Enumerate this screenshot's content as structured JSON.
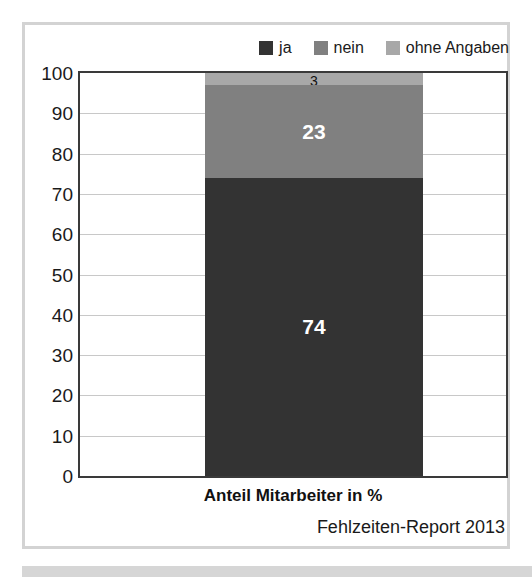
{
  "chart_data": {
    "type": "bar",
    "title": "",
    "subtitle": "",
    "xlabel": "Anteil Mitarbeiter in %",
    "ylabel": "",
    "categories": [
      "Anteil Mitarbeiter in %"
    ],
    "stacked": true,
    "ylim": [
      0,
      100
    ],
    "yticks": [
      0,
      10,
      20,
      30,
      40,
      50,
      60,
      70,
      80,
      90,
      100
    ],
    "ytick_labels": [
      "0",
      "10",
      "20",
      "30",
      "40",
      "50",
      "60",
      "70",
      "80",
      "90",
      "100"
    ],
    "grid": true,
    "legend_position": "top-right",
    "series": [
      {
        "name": "ja",
        "values": [
          74
        ],
        "color": "#333333",
        "label": "74",
        "label_color": "#ffffff"
      },
      {
        "name": "nein",
        "values": [
          23
        ],
        "color": "#808080",
        "label": "23",
        "label_color": "#ffffff"
      },
      {
        "name": "ohne Angaben",
        "values": [
          3
        ],
        "color": "#a8a8a8",
        "label": "3",
        "label_color": "#111111"
      }
    ],
    "annotations": [
      "Fehlzeiten-Report 2013"
    ]
  },
  "legend": {
    "items": [
      {
        "label": "ja",
        "color": "#333333"
      },
      {
        "label": "nein",
        "color": "#808080"
      },
      {
        "label": "ohne Angaben",
        "color": "#a8a8a8"
      }
    ]
  },
  "axis": {
    "y_labels": [
      "100",
      "90",
      "80",
      "70",
      "60",
      "50",
      "40",
      "30",
      "20",
      "10",
      "0"
    ],
    "x_title": "Anteil Mitarbeiter in %"
  },
  "bar": {
    "segments": [
      {
        "name": "ohne Angaben",
        "value": 3,
        "label": "3"
      },
      {
        "name": "nein",
        "value": 23,
        "label": "23"
      },
      {
        "name": "ja",
        "value": 74,
        "label": "74"
      }
    ]
  },
  "source": {
    "text": "Fehlzeiten-Report 2013"
  },
  "colors": {
    "ja": "#333333",
    "nein": "#808080",
    "ohne_angaben": "#a8a8a8",
    "axis": "#3a3a3a",
    "grid": "#c8c8c8",
    "frame": "#d3d3d3"
  }
}
